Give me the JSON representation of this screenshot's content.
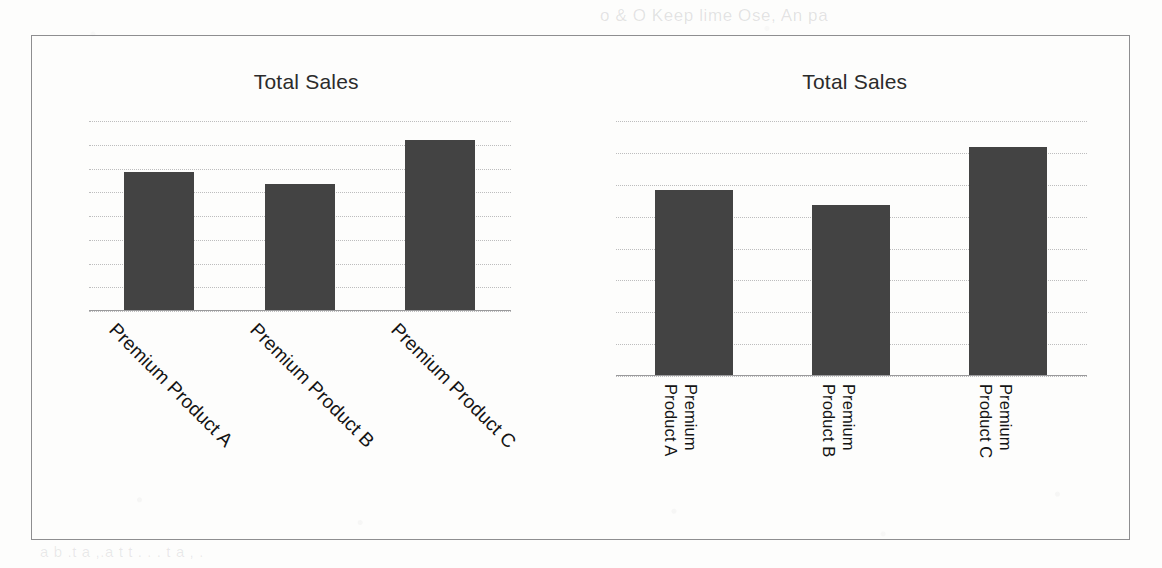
{
  "page": {
    "bleed_top_text": "o & O Keep lime Ose, An pa",
    "bleed_bottom_text": "a b .t   a  ,.a  t   t  . .  .   t    a  ,   ."
  },
  "figure": {
    "charts": [
      {
        "name": "left-chart",
        "label_style": "diagonal-45",
        "chart_data": {
          "type": "bar",
          "title": "Total Sales",
          "xlabel": "",
          "ylabel": "",
          "categories": [
            "Premium Product A",
            "Premium Product B",
            "Premium Product C"
          ],
          "values": [
            73,
            67,
            90
          ],
          "ylim": [
            0,
            100
          ],
          "grid": true,
          "gridline_count": 9,
          "legend": "none",
          "bar_color": "#434343"
        }
      },
      {
        "name": "right-chart",
        "label_style": "vertical-90",
        "chart_data": {
          "type": "bar",
          "title": "Total Sales",
          "xlabel": "",
          "ylabel": "",
          "categories": [
            "Premium\nProduct A",
            "Premium\nProduct B",
            "Premium\nProduct C"
          ],
          "values": [
            73,
            67,
            90
          ],
          "ylim": [
            0,
            100
          ],
          "grid": true,
          "gridline_count": 9,
          "legend": "none",
          "bar_color": "#434343"
        }
      }
    ]
  },
  "colors": {
    "bar": "#434343",
    "gridline": "#96969a",
    "axis": "#9a9a9c",
    "frame": "#8e8e90",
    "title_text": "#2b2b2b",
    "label_text": "#141414",
    "page_background": "#fdfdfc"
  }
}
